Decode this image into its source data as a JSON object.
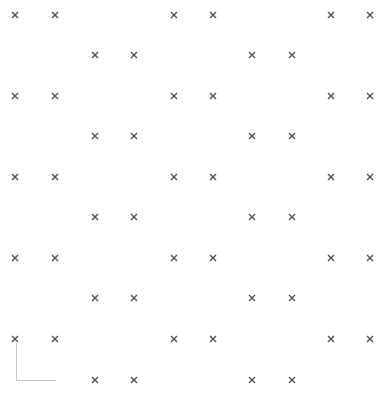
{
  "board": {
    "mark_color": "#555555",
    "mark_icon": "cross-icon",
    "corner_color": "#c8c8c8",
    "pattern_a_columns": [
      15,
      55,
      174,
      213,
      331,
      370
    ],
    "pattern_b_columns": [
      95,
      134,
      252,
      292
    ],
    "pattern_a_rows": [
      15,
      96,
      177,
      258,
      339
    ],
    "pattern_b_rows": [
      55,
      136,
      217,
      298,
      380
    ]
  }
}
